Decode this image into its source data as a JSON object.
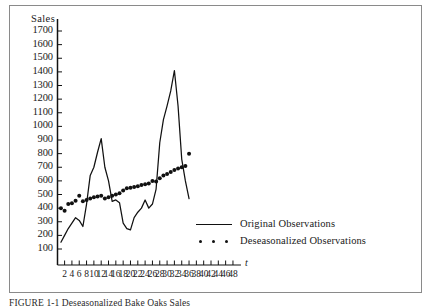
{
  "figure": {
    "caption": "FIGURE 1-1    Deseasonalized Bake Oaks Sales",
    "axis_name_x": "t",
    "axis_name_y": "Sales"
  },
  "legend": {
    "position": "inside-lower-right",
    "entries": [
      {
        "label": "Original Observations",
        "marker": "line"
      },
      {
        "label": "Deseasonalized Observations",
        "marker": "dots"
      }
    ]
  },
  "colors": {
    "ink": "#111111",
    "frame": "#8a8a8a",
    "background": "#ffffff"
  },
  "chart_data": {
    "type": "line",
    "title": "",
    "subtitle": "",
    "xlabel": "t",
    "ylabel": "Sales",
    "xlim": [
      0,
      49
    ],
    "ylim": [
      0,
      1750
    ],
    "grid": false,
    "legend_position": "inside lower right",
    "xticks": [
      2,
      4,
      6,
      8,
      10,
      12,
      14,
      16,
      18,
      20,
      22,
      24,
      26,
      28,
      30,
      32,
      34,
      36,
      38,
      40,
      42,
      44,
      46,
      48
    ],
    "yticks": [
      100,
      200,
      300,
      400,
      500,
      600,
      700,
      800,
      900,
      1000,
      1100,
      1200,
      1300,
      1400,
      1500,
      1600,
      1700
    ],
    "x": [
      1,
      2,
      3,
      4,
      5,
      6,
      7,
      8,
      9,
      10,
      11,
      12,
      13,
      14,
      15,
      16,
      17,
      18,
      19,
      20,
      21,
      22,
      23,
      24,
      25,
      26,
      27,
      28,
      29,
      30,
      31,
      32,
      33,
      34,
      35,
      36
    ],
    "series": [
      {
        "name": "Original Observations",
        "marker": "line",
        "values": [
          150,
          200,
          250,
          290,
          330,
          310,
          265,
          430,
          640,
          700,
          810,
          910,
          700,
          600,
          450,
          460,
          440,
          290,
          250,
          240,
          330,
          370,
          400,
          460,
          400,
          430,
          540,
          880,
          1050,
          1150,
          1260,
          1410,
          1150,
          760,
          600,
          470
        ]
      },
      {
        "name": "Deseasonalized Observations",
        "marker": "dots",
        "values": [
          400,
          380,
          430,
          435,
          455,
          490,
          450,
          460,
          470,
          480,
          485,
          490,
          470,
          480,
          490,
          500,
          510,
          530,
          545,
          550,
          555,
          560,
          570,
          575,
          580,
          600,
          595,
          620,
          640,
          650,
          665,
          680,
          690,
          700,
          710,
          800
        ]
      }
    ]
  }
}
